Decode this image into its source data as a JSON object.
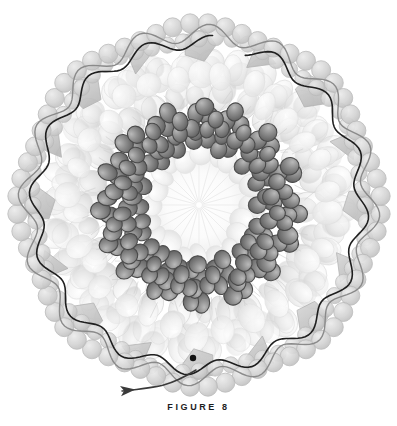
{
  "figure": {
    "caption": "FIGURE 8",
    "title": "FIGURE 8",
    "kind": "scientific-illustration"
  },
  "canvas": {
    "width": 397,
    "height": 426,
    "background": "#ffffff"
  },
  "geometry": {
    "center_x": 199,
    "center_y": 205,
    "outer_radius": 186,
    "rings": [
      {
        "name": "outer-beaded-shell",
        "radius": 178,
        "bead_radius": 9.5,
        "count": 64,
        "fill": "#d8d8d8",
        "stroke": "#b9b9b9"
      },
      {
        "name": "pentagon-facet-ring",
        "radius": 160,
        "count": 16,
        "fill": "#c9c9c9",
        "stroke": "#b0b0b0"
      },
      {
        "name": "capsomer-ring-outer",
        "radius": 140,
        "blob_radius": 15,
        "count": 34,
        "fill": "#efefef",
        "stroke": "#dcdcdc"
      },
      {
        "name": "capsomer-ring-middle",
        "radius": 112,
        "blob_radius": 14,
        "count": 28,
        "fill": "#e6e6e6",
        "stroke": "#d4d4d4"
      },
      {
        "name": "dark-sphere-ring-outer",
        "radius": 92,
        "sphere_radius": 8.5,
        "count": 16,
        "fill": "#7e7e7e",
        "stroke": "#4a4a4a"
      },
      {
        "name": "dark-sphere-ring-inner",
        "radius": 66,
        "sphere_radius": 8.0,
        "count": 16,
        "fill": "#8a8a8a",
        "stroke": "#4f4f4f"
      },
      {
        "name": "inner-pale-ring",
        "radius": 50,
        "blob_radius": 11,
        "count": 20,
        "fill": "#f2f2f2",
        "stroke": "#e2e2e2"
      },
      {
        "name": "core-radial-burst",
        "radius": 44,
        "spokes": 24,
        "fill": "#fafafa",
        "stroke": "#ececec"
      }
    ]
  },
  "annotations": {
    "trace_line": {
      "name": "dark-shell-trace",
      "color": "#1f1f1f",
      "width": 1.6,
      "description": "continuous dark wavy line tracing the outer capsid shell"
    },
    "secondary_trace": {
      "name": "gray-shell-trace",
      "color": "#8a8a8a",
      "width": 1.4,
      "description": "lighter gray wavy chain following the beaded outer ring"
    },
    "end_dot": {
      "name": "trace-terminus-dot",
      "cx": 193,
      "cy": 358,
      "r": 3.2,
      "color": "#141414"
    },
    "arrow": {
      "name": "direction-arrow",
      "color": "#3a3a3a",
      "tip_x": 122,
      "tip_y": 391,
      "tail_x": 196,
      "tail_y": 370,
      "label": ""
    }
  },
  "palette": {
    "background": "#ffffff",
    "pale_blob": "#efefef",
    "mid_blob": "#d8d8d8",
    "dark_sphere": "#808080",
    "dark_sphere_outline": "#4a4a4a",
    "trace_dark": "#1f1f1f",
    "trace_gray": "#8a8a8a",
    "caption_text": "#1d1d1d"
  }
}
